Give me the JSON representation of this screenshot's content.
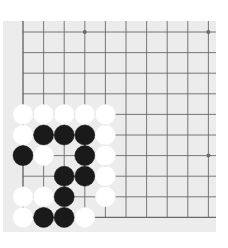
{
  "board": {
    "background": "#ececec",
    "line_color": "#6a6a6a",
    "origin": {
      "x": 23,
      "y": 32
    },
    "spacing": 20.6,
    "columns": 10,
    "rows": 10,
    "edges": {
      "left": true,
      "top": false,
      "right": false,
      "bottom": true
    },
    "star_points": [
      [
        3,
        0
      ],
      [
        9,
        0
      ],
      [
        9,
        6
      ]
    ],
    "stone_radius": 10,
    "stones": [
      {
        "col": 0,
        "row": 4,
        "color": "white"
      },
      {
        "col": 1,
        "row": 4,
        "color": "white"
      },
      {
        "col": 2,
        "row": 4,
        "color": "white"
      },
      {
        "col": 3,
        "row": 4,
        "color": "white"
      },
      {
        "col": 4,
        "row": 4,
        "color": "white"
      },
      {
        "col": 0,
        "row": 5,
        "color": "white"
      },
      {
        "col": 1,
        "row": 5,
        "color": "black"
      },
      {
        "col": 2,
        "row": 5,
        "color": "black"
      },
      {
        "col": 3,
        "row": 5,
        "color": "black"
      },
      {
        "col": 4,
        "row": 5,
        "color": "white"
      },
      {
        "col": 0,
        "row": 6,
        "color": "black"
      },
      {
        "col": 1,
        "row": 6,
        "color": "white"
      },
      {
        "col": 3,
        "row": 6,
        "color": "black"
      },
      {
        "col": 4,
        "row": 6,
        "color": "white"
      },
      {
        "col": 2,
        "row": 7,
        "color": "black"
      },
      {
        "col": 3,
        "row": 7,
        "color": "black"
      },
      {
        "col": 4,
        "row": 7,
        "color": "white"
      },
      {
        "col": 0,
        "row": 8,
        "color": "white"
      },
      {
        "col": 1,
        "row": 8,
        "color": "white"
      },
      {
        "col": 2,
        "row": 8,
        "color": "black"
      },
      {
        "col": 4,
        "row": 8,
        "color": "white"
      },
      {
        "col": 0,
        "row": 9,
        "color": "white"
      },
      {
        "col": 1,
        "row": 9,
        "color": "black"
      },
      {
        "col": 2,
        "row": 9,
        "color": "black"
      },
      {
        "col": 3,
        "row": 9,
        "color": "white"
      }
    ],
    "colors": {
      "black": "#1a1a1a",
      "white": "#ffffff"
    }
  }
}
